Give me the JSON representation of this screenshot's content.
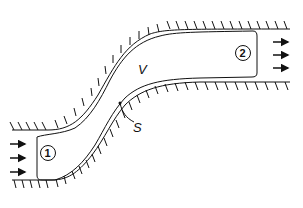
{
  "diagram": {
    "type": "control-volume-flow-duct",
    "labels": {
      "volume": "V",
      "surface": "S",
      "inlet": "1",
      "outlet": "2"
    },
    "inlet_arrows": 3,
    "outlet_arrows": 3,
    "colors": {
      "stroke": "#111111",
      "background": "#ffffff"
    }
  }
}
